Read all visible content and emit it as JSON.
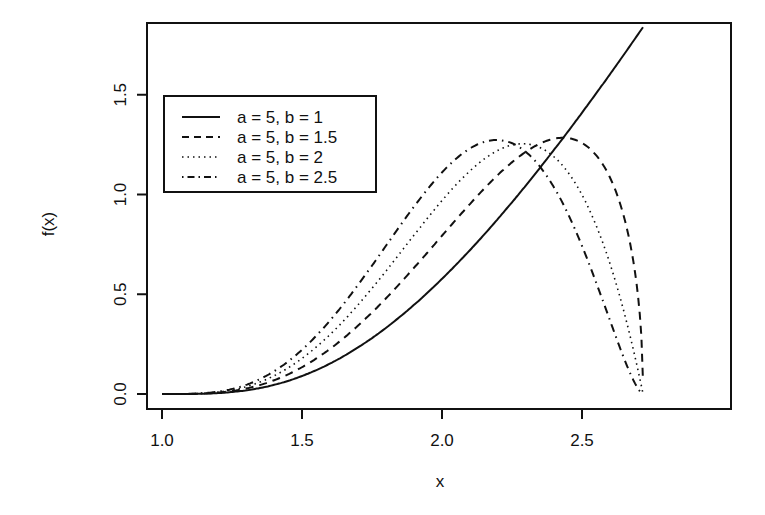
{
  "chart_data": {
    "type": "line",
    "title": "",
    "xlabel": "x",
    "ylabel": "f(x)",
    "xlim": [
      0.95,
      2.8
    ],
    "ylim": [
      0,
      1.85
    ],
    "x_ticks": [
      "1.0",
      "1.5",
      "2.0",
      "2.5"
    ],
    "y_ticks": [
      "0.0",
      "0.5",
      "1.0",
      "1.5"
    ],
    "grid": false,
    "legend_position": "upper left",
    "x_domain": [
      1.0,
      2.718
    ],
    "series": [
      {
        "name": "a = 5, b = 1",
        "a": 5,
        "b": 1,
        "style": "solid",
        "x": [
          1.0,
          1.25,
          1.5,
          1.75,
          2.0,
          2.25,
          2.5,
          2.718
        ],
        "values": [
          0.0,
          0.009,
          0.068,
          0.211,
          0.577,
          0.882,
          1.339,
          1.84
        ]
      },
      {
        "name": "a = 5, b = 1.5",
        "a": 5,
        "b": 1.5,
        "style": "dashed",
        "x": [
          1.0,
          1.25,
          1.5,
          1.75,
          2.0,
          2.25,
          2.5,
          2.718
        ],
        "values": [
          0.0,
          0.013,
          0.101,
          0.31,
          0.66,
          1.0,
          1.16,
          0.5
        ]
      },
      {
        "name": "a = 5, b = 2",
        "a": 5,
        "b": 2,
        "style": "dotted",
        "x": [
          1.0,
          1.25,
          1.5,
          1.75,
          2.0,
          2.25,
          2.5,
          2.718
        ],
        "values": [
          0.0,
          0.018,
          0.135,
          0.42,
          0.85,
          1.12,
          0.85,
          0.1
        ]
      },
      {
        "name": "a = 5, b = 2.5",
        "a": 5,
        "b": 2.5,
        "style": "dashdot",
        "x": [
          1.0,
          1.25,
          1.5,
          1.75,
          2.0,
          2.25,
          2.5,
          2.718
        ],
        "values": [
          0.0,
          0.022,
          0.168,
          0.52,
          1.14,
          0.92,
          0.45,
          0.03
        ]
      }
    ]
  },
  "legend": {
    "items": [
      {
        "label": "a = 5, b = 1"
      },
      {
        "label": "a = 5, b = 1.5"
      },
      {
        "label": "a = 5, b = 2"
      },
      {
        "label": "a = 5, b = 2.5"
      }
    ]
  },
  "axes": {
    "xlabel": "x",
    "ylabel": "f(x)",
    "x_ticks": [
      {
        "label": "1.0",
        "value": 1.0
      },
      {
        "label": "1.5",
        "value": 1.5
      },
      {
        "label": "2.0",
        "value": 2.0
      },
      {
        "label": "2.5",
        "value": 2.5
      }
    ],
    "y_ticks": [
      {
        "label": "0.0",
        "value": 0.0
      },
      {
        "label": "0.5",
        "value": 0.5
      },
      {
        "label": "1.0",
        "value": 1.0
      },
      {
        "label": "1.5",
        "value": 1.5
      }
    ]
  }
}
